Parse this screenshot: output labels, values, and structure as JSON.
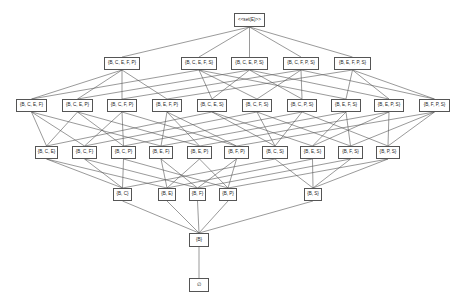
{
  "diagram": {
    "type": "hasse-diagram",
    "line_color": "#555555",
    "box_border_color": "#555555",
    "text_color": "#222222",
    "nodes": [
      {
        "id": "top",
        "label": "<<set(E)>>",
        "elems": "BCEFPS",
        "x": 234,
        "y": 13,
        "w": 31,
        "h": 14
      },
      {
        "id": "BCEFP",
        "label": "{B, C, E, F, P}",
        "elems": "BCEFP",
        "x": 104,
        "y": 57,
        "w": 36,
        "h": 13
      },
      {
        "id": "BCEFS",
        "label": "{B, C, E, F, S}",
        "elems": "BCEFS",
        "x": 181,
        "y": 57,
        "w": 36,
        "h": 13
      },
      {
        "id": "BCEPS",
        "label": "{B, C, E, P, S}",
        "elems": "BCEPS",
        "x": 231,
        "y": 57,
        "w": 37,
        "h": 13
      },
      {
        "id": "BCFPS",
        "label": "{B, C, F, P, S}",
        "elems": "BCFPS",
        "x": 283,
        "y": 57,
        "w": 36,
        "h": 13
      },
      {
        "id": "BEFPS",
        "label": "{B, E, F, P, S}",
        "elems": "BEFPS",
        "x": 334,
        "y": 57,
        "w": 37,
        "h": 13
      },
      {
        "id": "BCEF",
        "label": "{B, C, E, F}",
        "elems": "BCEF",
        "x": 16,
        "y": 99,
        "w": 31,
        "h": 13
      },
      {
        "id": "BCEP",
        "label": "{B, C, E, P}",
        "elems": "BCEP",
        "x": 62,
        "y": 99,
        "w": 31,
        "h": 13
      },
      {
        "id": "BCFP",
        "label": "{B, C, F, P}",
        "elems": "BCFP",
        "x": 107,
        "y": 99,
        "w": 30,
        "h": 13
      },
      {
        "id": "BEFP",
        "label": "{B, E, F, P}",
        "elems": "BEFP",
        "x": 152,
        "y": 99,
        "w": 30,
        "h": 13
      },
      {
        "id": "BCES",
        "label": "{B, C, E, S}",
        "elems": "BCES",
        "x": 197,
        "y": 99,
        "w": 30,
        "h": 13
      },
      {
        "id": "BCFS",
        "label": "{B, C, F, S}",
        "elems": "BCFS",
        "x": 242,
        "y": 99,
        "w": 30,
        "h": 13
      },
      {
        "id": "BCPS",
        "label": "{B, C, P, S}",
        "elems": "BCPS",
        "x": 287,
        "y": 99,
        "w": 30,
        "h": 13
      },
      {
        "id": "BEFS",
        "label": "{B, E, F, S}",
        "elems": "BEFS",
        "x": 331,
        "y": 99,
        "w": 30,
        "h": 13
      },
      {
        "id": "BEPS",
        "label": "{B, E, P, S}",
        "elems": "BEPS",
        "x": 374,
        "y": 99,
        "w": 30,
        "h": 13
      },
      {
        "id": "BFPS",
        "label": "{B, F, P, S}",
        "elems": "BFPS",
        "x": 419,
        "y": 99,
        "w": 31,
        "h": 13
      },
      {
        "id": "BCE",
        "label": "{B, C, E}",
        "elems": "BCE",
        "x": 35,
        "y": 146,
        "w": 23,
        "h": 13
      },
      {
        "id": "BCF",
        "label": "{B, C, F}",
        "elems": "BCF",
        "x": 72,
        "y": 146,
        "w": 25,
        "h": 13
      },
      {
        "id": "BCP",
        "label": "{B, C, P}",
        "elems": "BCP",
        "x": 111,
        "y": 146,
        "w": 25,
        "h": 13
      },
      {
        "id": "BEF",
        "label": "{B, E, F}",
        "elems": "BEF",
        "x": 149,
        "y": 146,
        "w": 24,
        "h": 13
      },
      {
        "id": "BEP",
        "label": "{B, E, P}",
        "elems": "BEP",
        "x": 187,
        "y": 146,
        "w": 25,
        "h": 13
      },
      {
        "id": "BFP",
        "label": "{B, F, P}",
        "elems": "BFP",
        "x": 224,
        "y": 146,
        "w": 25,
        "h": 13
      },
      {
        "id": "BCS",
        "label": "{B, C, S}",
        "elems": "BCS",
        "x": 262,
        "y": 146,
        "w": 26,
        "h": 13
      },
      {
        "id": "BES",
        "label": "{B, E, S}",
        "elems": "BES",
        "x": 300,
        "y": 146,
        "w": 25,
        "h": 13
      },
      {
        "id": "BFS",
        "label": "{B, F, S}",
        "elems": "BFS",
        "x": 338,
        "y": 146,
        "w": 25,
        "h": 13
      },
      {
        "id": "BPS",
        "label": "{B, P, S}",
        "elems": "BPS",
        "x": 376,
        "y": 146,
        "w": 24,
        "h": 13
      },
      {
        "id": "BC",
        "label": "{B, C}",
        "elems": "BC",
        "x": 113,
        "y": 188,
        "w": 19,
        "h": 13
      },
      {
        "id": "BE",
        "label": "{B, E}",
        "elems": "BE",
        "x": 158,
        "y": 188,
        "w": 18,
        "h": 13
      },
      {
        "id": "BF",
        "label": "{B, F}",
        "elems": "BF",
        "x": 189,
        "y": 188,
        "w": 17,
        "h": 13
      },
      {
        "id": "BP",
        "label": "{B, P}",
        "elems": "BP",
        "x": 219,
        "y": 188,
        "w": 18,
        "h": 13
      },
      {
        "id": "BS",
        "label": "{B, S}",
        "elems": "BS",
        "x": 304,
        "y": 188,
        "w": 18,
        "h": 13
      },
      {
        "id": "B",
        "label": "{B}",
        "elems": "B",
        "x": 189,
        "y": 233,
        "w": 20,
        "h": 14
      },
      {
        "id": "empty",
        "label": "∅",
        "elems": "",
        "x": 189,
        "y": 278,
        "w": 20,
        "h": 14
      }
    ],
    "edges": [
      [
        "top",
        "BCEFP"
      ],
      [
        "top",
        "BCEFS"
      ],
      [
        "top",
        "BCEPS"
      ],
      [
        "top",
        "BCFPS"
      ],
      [
        "top",
        "BEFPS"
      ],
      [
        "BCEFP",
        "BCEF"
      ],
      [
        "BCEFP",
        "BCEP"
      ],
      [
        "BCEFP",
        "BCFP"
      ],
      [
        "BCEFP",
        "BEFP"
      ],
      [
        "BCEFS",
        "BCEF"
      ],
      [
        "BCEFS",
        "BCES"
      ],
      [
        "BCEFS",
        "BCFS"
      ],
      [
        "BCEFS",
        "BEFS"
      ],
      [
        "BCEPS",
        "BCEP"
      ],
      [
        "BCEPS",
        "BCES"
      ],
      [
        "BCEPS",
        "BCPS"
      ],
      [
        "BCEPS",
        "BEPS"
      ],
      [
        "BCFPS",
        "BCFP"
      ],
      [
        "BCFPS",
        "BCFS"
      ],
      [
        "BCFPS",
        "BCPS"
      ],
      [
        "BCFPS",
        "BFPS"
      ],
      [
        "BEFPS",
        "BEFP"
      ],
      [
        "BEFPS",
        "BEFS"
      ],
      [
        "BEFPS",
        "BEPS"
      ],
      [
        "BEFPS",
        "BFPS"
      ],
      [
        "BCEF",
        "BCE"
      ],
      [
        "BCEF",
        "BCF"
      ],
      [
        "BCEF",
        "BEF"
      ],
      [
        "BCEP",
        "BCE"
      ],
      [
        "BCEP",
        "BCP"
      ],
      [
        "BCEP",
        "BEP"
      ],
      [
        "BCFP",
        "BCF"
      ],
      [
        "BCFP",
        "BCP"
      ],
      [
        "BCFP",
        "BFP"
      ],
      [
        "BEFP",
        "BEF"
      ],
      [
        "BEFP",
        "BEP"
      ],
      [
        "BEFP",
        "BFP"
      ],
      [
        "BCES",
        "BCE"
      ],
      [
        "BCES",
        "BCS"
      ],
      [
        "BCES",
        "BES"
      ],
      [
        "BCFS",
        "BCF"
      ],
      [
        "BCFS",
        "BCS"
      ],
      [
        "BCFS",
        "BFS"
      ],
      [
        "BCPS",
        "BCP"
      ],
      [
        "BCPS",
        "BCS"
      ],
      [
        "BCPS",
        "BPS"
      ],
      [
        "BEFS",
        "BEF"
      ],
      [
        "BEFS",
        "BES"
      ],
      [
        "BEFS",
        "BFS"
      ],
      [
        "BEPS",
        "BEP"
      ],
      [
        "BEPS",
        "BES"
      ],
      [
        "BEPS",
        "BPS"
      ],
      [
        "BFPS",
        "BFP"
      ],
      [
        "BFPS",
        "BFS"
      ],
      [
        "BFPS",
        "BPS"
      ],
      [
        "BCE",
        "BC"
      ],
      [
        "BCE",
        "BE"
      ],
      [
        "BCF",
        "BC"
      ],
      [
        "BCF",
        "BF"
      ],
      [
        "BCP",
        "BC"
      ],
      [
        "BCP",
        "BP"
      ],
      [
        "BEF",
        "BE"
      ],
      [
        "BEF",
        "BF"
      ],
      [
        "BEP",
        "BE"
      ],
      [
        "BEP",
        "BP"
      ],
      [
        "BFP",
        "BF"
      ],
      [
        "BFP",
        "BP"
      ],
      [
        "BCS",
        "BC"
      ],
      [
        "BCS",
        "BS"
      ],
      [
        "BES",
        "BE"
      ],
      [
        "BES",
        "BS"
      ],
      [
        "BFS",
        "BF"
      ],
      [
        "BFS",
        "BS"
      ],
      [
        "BPS",
        "BP"
      ],
      [
        "BPS",
        "BS"
      ],
      [
        "BC",
        "B"
      ],
      [
        "BE",
        "B"
      ],
      [
        "BF",
        "B"
      ],
      [
        "BP",
        "B"
      ],
      [
        "BS",
        "B"
      ],
      [
        "B",
        "empty"
      ]
    ]
  }
}
